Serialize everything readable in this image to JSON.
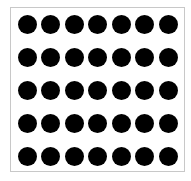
{
  "diagram": {
    "type": "dot-array",
    "rows": 5,
    "columns": 7,
    "total_dots": 35,
    "dot_color": "#000000",
    "frame_border_color": "#c8c8c8",
    "background_color": "#ffffff"
  }
}
